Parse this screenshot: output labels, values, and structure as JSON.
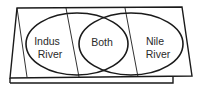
{
  "diagram": {
    "type": "venn-foldable",
    "left_set": {
      "line1": "Indus",
      "line2": "River"
    },
    "intersection": {
      "label": "Both"
    },
    "right_set": {
      "line1": "Nile",
      "line2": "River"
    },
    "colors": {
      "stroke": "#1a1a1a",
      "background": "#ffffff",
      "text": "#2a2a2a"
    }
  }
}
